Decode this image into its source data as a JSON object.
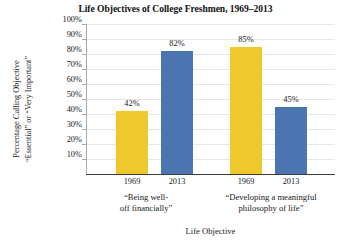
{
  "chart_data": {
    "type": "bar",
    "title": "Life Objectives of College Freshmen, 1969–2013",
    "xlabel": "Life Objective",
    "ylabel": "Percentage Calling Objective “Essential” or “Very Important”",
    "ylabel_line1": "Percentage Calling Objective",
    "ylabel_line2": "“Essential” or “Very Important”",
    "ylim": [
      0,
      100
    ],
    "ytick_labels": [
      "100%",
      "90%",
      "80%",
      "70%",
      "60%",
      "50%",
      "40%",
      "30%",
      "20%",
      "10%"
    ],
    "ytick_values": [
      100,
      90,
      80,
      70,
      60,
      50,
      40,
      30,
      20,
      10
    ],
    "grid": true,
    "legend": "none",
    "categories": [
      {
        "label_line1": "“Being well-",
        "label_line2": "off financially”",
        "label": "“Being well-off financially”"
      },
      {
        "label_line1": "“Developing a meaningful",
        "label_line2": "philosophy of life”",
        "label": "“Developing a meaningful philosophy of life”"
      }
    ],
    "series": [
      {
        "name": "1969",
        "values": [
          42,
          85
        ],
        "color": "#EFC82E"
      },
      {
        "name": "2013",
        "values": [
          82,
          45
        ],
        "color": "#4B75B0"
      }
    ],
    "bars": [
      {
        "group": 0,
        "year": "1969",
        "value": 42,
        "value_label": "42%",
        "color": "#EFC82E"
      },
      {
        "group": 0,
        "year": "2013",
        "value": 82,
        "value_label": "82%",
        "color": "#4B75B0"
      },
      {
        "group": 1,
        "year": "1969",
        "value": 85,
        "value_label": "85%",
        "color": "#EFC82E"
      },
      {
        "group": 1,
        "year": "2013",
        "value": 45,
        "value_label": "45%",
        "color": "#4B75B0"
      }
    ]
  },
  "colors": {
    "bar_1969": "#EFC82E",
    "bar_2013": "#4B75B0",
    "gridline": "#E6E6E6",
    "axis": "#3A3A3A",
    "y_axis": "#A9A9A9",
    "text": "#1A1A1A",
    "background": "#FFFFFF"
  }
}
